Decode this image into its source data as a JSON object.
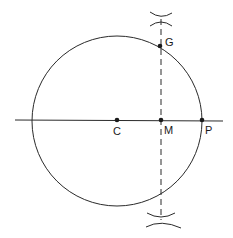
{
  "diagram": {
    "type": "geometric-construction",
    "stroke_color": "#2a2a2a",
    "background": "#ffffff",
    "circle": {
      "center_label": "C",
      "cx": 117,
      "cy": 121,
      "r": 85
    },
    "points": [
      {
        "label": "C",
        "x": 117,
        "y": 120
      },
      {
        "label": "M",
        "x": 161,
        "y": 120
      },
      {
        "label": "P",
        "x": 202,
        "y": 120
      },
      {
        "label": "G",
        "x": 160,
        "y": 46
      }
    ],
    "lines": [
      {
        "name": "horizontal-line",
        "style": "solid",
        "x1": 15,
        "y1": 120,
        "x2": 223,
        "y2": 121
      },
      {
        "name": "perpendicular-bisector",
        "style": "dashed",
        "x1": 161,
        "y1": 19,
        "x2": 161,
        "y2": 220
      }
    ],
    "arc_marks": [
      {
        "name": "top-arc-intersection",
        "x": 161,
        "y": 19
      },
      {
        "name": "bottom-arc-intersection",
        "x": 161,
        "y": 220
      }
    ]
  }
}
